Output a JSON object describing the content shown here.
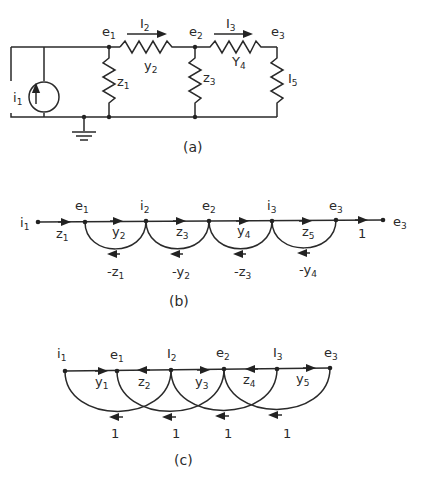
{
  "figure": {
    "panels": [
      {
        "id": "a",
        "caption": "(a)",
        "type": "circuit",
        "source": {
          "label": "i",
          "sub": "1"
        },
        "nodes": [
          {
            "label": "e",
            "sub": "1"
          },
          {
            "label": "e",
            "sub": "2"
          },
          {
            "label": "e",
            "sub": "3"
          }
        ],
        "series_elements": [
          {
            "label": "y",
            "sub": "2",
            "current": {
              "label": "I",
              "sub": "2"
            }
          },
          {
            "label": "Y",
            "sub": "4",
            "current": {
              "label": "I",
              "sub": "3"
            }
          }
        ],
        "shunt_elements": [
          {
            "label": "z",
            "sub": "1"
          },
          {
            "label": "z",
            "sub": "3"
          },
          {
            "label": "I",
            "sub": "5"
          }
        ]
      },
      {
        "id": "b",
        "caption": "(b)",
        "type": "signal-flow-graph",
        "nodes": [
          {
            "label": "i",
            "sub": "1"
          },
          {
            "label": "e",
            "sub": "1"
          },
          {
            "label": "i",
            "sub": "2"
          },
          {
            "label": "e",
            "sub": "2"
          },
          {
            "label": "i",
            "sub": "3"
          },
          {
            "label": "e",
            "sub": "3"
          },
          {
            "label": "e",
            "sub": "3"
          }
        ],
        "forward_branches": [
          {
            "label": "z",
            "sub": "1"
          },
          {
            "label": "y",
            "sub": "2"
          },
          {
            "label": "z",
            "sub": "3"
          },
          {
            "label": "y",
            "sub": "4"
          },
          {
            "label": "z",
            "sub": "5"
          },
          {
            "label": "1",
            "sub": ""
          }
        ],
        "feedback_branches": [
          {
            "label": "-z",
            "sub": "1"
          },
          {
            "label": "-y",
            "sub": "2"
          },
          {
            "label": "-z",
            "sub": "3"
          },
          {
            "label": "-y",
            "sub": "4"
          }
        ]
      },
      {
        "id": "c",
        "caption": "(c)",
        "type": "signal-flow-graph",
        "nodes": [
          {
            "label": "i",
            "sub": "1"
          },
          {
            "label": "e",
            "sub": "1"
          },
          {
            "label": "I",
            "sub": "2"
          },
          {
            "label": "e",
            "sub": "2"
          },
          {
            "label": "I",
            "sub": "3"
          },
          {
            "label": "e",
            "sub": "3"
          }
        ],
        "branches": [
          {
            "label": "y",
            "sub": "1"
          },
          {
            "label": "z",
            "sub": "2"
          },
          {
            "label": "y",
            "sub": "3"
          },
          {
            "label": "z",
            "sub": "4"
          },
          {
            "label": "y",
            "sub": "5"
          }
        ],
        "loop_branches": [
          {
            "label": "1"
          },
          {
            "label": "1"
          },
          {
            "label": "1"
          },
          {
            "label": "1"
          }
        ]
      }
    ]
  }
}
